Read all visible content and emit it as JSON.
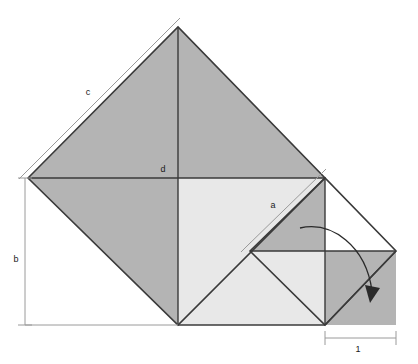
{
  "figure": {
    "type": "geometric-diagram",
    "width": 418,
    "height": 364,
    "background_color": "#ffffff"
  },
  "colors": {
    "fill_dark": "#b4b4b4",
    "fill_light": "#e8e8e8",
    "stroke_dark": "#3a3a3a",
    "stroke_thin": "#8a8a8a",
    "dimension_line": "#9a9a9a",
    "label_text": "#1a1a1a",
    "arrow": "#2a2a2a",
    "white": "#ffffff"
  },
  "labels": {
    "c": {
      "text": "c",
      "x": 88,
      "y": 95
    },
    "d": {
      "text": "d",
      "x": 163,
      "y": 172
    },
    "a": {
      "text": "a",
      "x": 273,
      "y": 208
    },
    "b": {
      "text": "b",
      "x": 16,
      "y": 262
    },
    "one": {
      "text": "1",
      "x": 358,
      "y": 352
    }
  },
  "dimensions": [
    {
      "name": "c",
      "label": "c",
      "kind": "diagonal",
      "x1": 24,
      "y1": 174,
      "x2": 175,
      "y2": 23
    },
    {
      "name": "a",
      "label": "a",
      "kind": "diagonal",
      "x1": 246,
      "y1": 247,
      "x2": 321,
      "y2": 174
    },
    {
      "name": "b",
      "label": "b",
      "kind": "vertical",
      "x": 25,
      "y1": 178,
      "y2": 325
    },
    {
      "name": "one",
      "label": "1",
      "kind": "horizontal",
      "y": 338,
      "x1": 325,
      "x2": 396
    }
  ],
  "geometry": {
    "large_square_vertices": "28,178 178,27 325,178 178,325",
    "large_square_center": {
      "x": 178,
      "y": 178
    },
    "small_square_vertices": "250,251 325,178 396,251 325,325",
    "small_square_center": {
      "x": 325,
      "y": 251
    },
    "inner_light_square": "178,178 325,178 325,325 178,325",
    "bottom_right_square": "325,251 396,251 396,325 325,325"
  },
  "shapes": [
    {
      "name": "large-square-upper-left-triangle",
      "points": "28,178 178,27 178,178",
      "fill": "fill_dark"
    },
    {
      "name": "large-square-upper-right-triangle",
      "points": "178,27 325,178 178,178",
      "fill": "fill_dark"
    },
    {
      "name": "large-square-lower-left-triangle",
      "points": "28,178 178,178 178,325",
      "fill": "fill_dark"
    },
    {
      "name": "inner-light-square",
      "points": "178,178 325,178 325,325 178,325",
      "fill": "fill_light"
    },
    {
      "name": "small-square-upper-triangle",
      "points": "250,251 325,178 325,251",
      "fill": "fill_dark"
    },
    {
      "name": "bottom-right-grey-square",
      "points": "325,251 396,251 396,325 325,325",
      "fill": "fill_dark"
    },
    {
      "name": "small-square-lower-right-triangle",
      "points": "325,251 396,251 325,325",
      "fill": "fill_dark"
    }
  ],
  "arrow": {
    "name": "rotation-arrow",
    "path": "M 300 228 C 330 222, 365 245, 372 292",
    "head": "366,286 379,290 371,302"
  }
}
